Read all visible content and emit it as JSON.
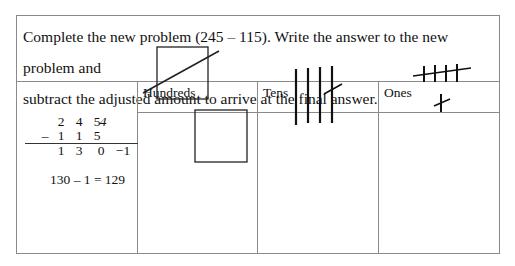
{
  "prompt": {
    "line1": "Complete the new problem (245 – 115). Write the answer to the new problem and",
    "line2": "subtract the adjusted amount to arrive at the final answer."
  },
  "columns": {
    "hundreds": "Hundreds",
    "tens": "Tens",
    "ones": "Ones"
  },
  "work": {
    "top_digits": [
      "2",
      "4",
      "5"
    ],
    "top_ones_crossed_mark": "4",
    "minus_sign": "–",
    "bottom_digits": [
      "1",
      "1",
      "5"
    ],
    "result_digits": [
      "1",
      "3",
      "0"
    ],
    "adjustment": "−1",
    "final_equation": "130 – 1 = 129"
  },
  "models": {
    "hundreds": {
      "squares": 2,
      "crossed_out": 1
    },
    "tens": {
      "sticks": 4,
      "crossed_out": 1
    },
    "ones": {
      "tally_marks_row1": 4,
      "crossed_out_row1": 4,
      "tally_marks_row2": 1,
      "crossed_out_row2": 1
    }
  }
}
